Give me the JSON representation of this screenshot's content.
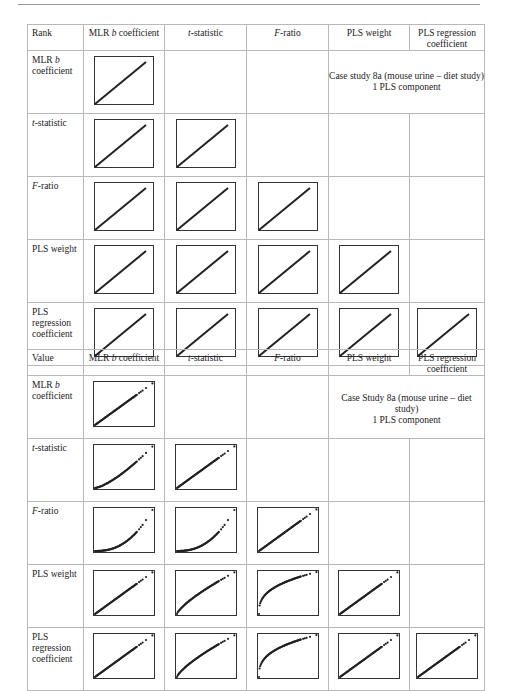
{
  "tables": [
    {
      "corner_label": "Rank",
      "columns": [
        "MLR b coefficient",
        "t-statistic",
        "F-ratio",
        "PLS weight",
        "PLS regression coefficient"
      ],
      "rows": [
        "MLR b coefficient",
        "t-statistic",
        "F-ratio",
        "PLS weight",
        "PLS regression coefficient"
      ],
      "annotation": {
        "line1": "Case study 8a (mouse urine – diet study)",
        "line2": "1 PLS component"
      },
      "plots": [
        [
          "line"
        ],
        [
          "line",
          "line"
        ],
        [
          "line",
          "line",
          "line"
        ],
        [
          "line",
          "line",
          "line",
          "line"
        ],
        [
          "line",
          "line",
          "line",
          "line",
          "line"
        ]
      ]
    },
    {
      "corner_label": "Value",
      "columns": [
        "MLR b coefficient",
        "t-statistic",
        "F-ratio",
        "PLS weight",
        "PLS regression coefficient"
      ],
      "rows": [
        "MLR b coefficient",
        "t-statistic",
        "F-ratio",
        "PLS weight",
        "PLS regression coefficient"
      ],
      "annotation": {
        "line1": "Case Study 8a (mouse urine – diet study)",
        "line2": "1 PLS component"
      },
      "plots": [
        [
          "linear"
        ],
        [
          "convex-mild",
          "linear"
        ],
        [
          "convex-strong",
          "convex-strong",
          "linear"
        ],
        [
          "linear",
          "concave-mild",
          "concave-strong",
          "linear"
        ],
        [
          "linear",
          "concave-mild",
          "concave-strong",
          "linear",
          "linear"
        ]
      ]
    }
  ],
  "chart_data": [
    {
      "type": "scatter",
      "title": "Rank vs rank comparison of variable importance measures",
      "subtitle": "Case study 8a (mouse urine – diet study), 1 PLS component",
      "grid_row_header": "Rank",
      "variables": [
        "MLR b coefficient",
        "t-statistic",
        "F-ratio",
        "PLS weight",
        "PLS regression coefficient"
      ],
      "panels": "lower-triangle incl. diagonal; every panel shows a perfect straight diagonal line (identical ranks)",
      "relationship": [
        [
          "linear"
        ],
        [
          "linear",
          "linear"
        ],
        [
          "linear",
          "linear",
          "linear"
        ],
        [
          "linear",
          "linear",
          "linear",
          "linear"
        ],
        [
          "linear",
          "linear",
          "linear",
          "linear",
          "linear"
        ]
      ]
    },
    {
      "type": "scatter",
      "title": "Value vs value comparison of variable importance measures",
      "subtitle": "Case Study 8a (mouse urine – diet study), 1 PLS component",
      "grid_row_header": "Value",
      "variables": [
        "MLR b coefficient",
        "t-statistic",
        "F-ratio",
        "PLS weight",
        "PLS regression coefficient"
      ],
      "panels": "lower-triangle incl. diagonal; dense point clouds with a few isolated high-value outliers at top-right",
      "relationship": [
        [
          "linear"
        ],
        [
          "convex-mild",
          "linear"
        ],
        [
          "convex-strong",
          "convex-strong",
          "linear"
        ],
        [
          "linear",
          "concave-mild",
          "concave-strong",
          "linear"
        ],
        [
          "linear",
          "concave-mild",
          "concave-strong",
          "linear",
          "linear"
        ]
      ]
    }
  ]
}
